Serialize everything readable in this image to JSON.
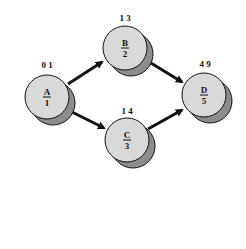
{
  "diagram": {
    "type": "activity-on-node network",
    "colors": {
      "node_fill": "#d9d9d9",
      "node_shadow": "#8c8c8c",
      "node_stroke": "#111111",
      "edge": "#111111",
      "background": "#ffffff"
    },
    "nodes": [
      {
        "id": "A",
        "name": "A",
        "duration": "1",
        "times": "0 1"
      },
      {
        "id": "B",
        "name": "B",
        "duration": "2",
        "times": "1 3"
      },
      {
        "id": "C",
        "name": "C",
        "duration": "3",
        "times": "1 4"
      },
      {
        "id": "D",
        "name": "D",
        "duration": "5",
        "times": "4 9"
      }
    ],
    "edges": [
      {
        "from": "A",
        "to": "B"
      },
      {
        "from": "A",
        "to": "C"
      },
      {
        "from": "B",
        "to": "D"
      },
      {
        "from": "C",
        "to": "D"
      }
    ]
  }
}
